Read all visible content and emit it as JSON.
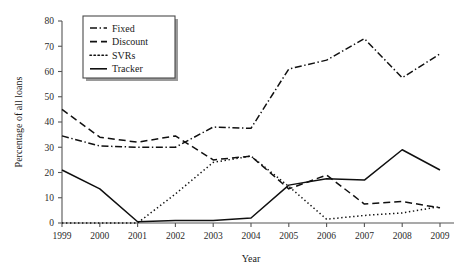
{
  "chart_data": {
    "type": "line",
    "title": "",
    "xlabel": "Year",
    "ylabel": "Percentage of all loans",
    "x": [
      1999,
      2000,
      2001,
      2002,
      2003,
      2004,
      2005,
      2006,
      2007,
      2008,
      2009
    ],
    "categories": [
      "1999",
      "2000",
      "2001",
      "2002",
      "2003",
      "2004",
      "2005",
      "2006",
      "2007",
      "2008",
      "2009"
    ],
    "xlim": [
      1999,
      2009
    ],
    "ylim": [
      0,
      80
    ],
    "ytick_values": [
      0,
      10,
      20,
      30,
      40,
      50,
      60,
      70,
      80
    ],
    "ytick_labels": [
      "0",
      "10",
      "20",
      "30",
      "40",
      "50",
      "60",
      "70",
      "80"
    ],
    "grid": false,
    "legend_position": "upper-left",
    "series": [
      {
        "name": "Fixed",
        "style": "dash-dot",
        "values": [
          34.5,
          30.5,
          30.0,
          30.0,
          38.0,
          37.5,
          61.0,
          64.5,
          73.0,
          57.5,
          67.0
        ]
      },
      {
        "name": "Discount",
        "style": "dashed",
        "values": [
          45.0,
          34.0,
          32.0,
          34.5,
          25.0,
          26.5,
          13.5,
          19.0,
          7.5,
          8.5,
          6.0
        ]
      },
      {
        "name": "SVRs",
        "style": "dotted",
        "values": [
          0.0,
          0.0,
          0.0,
          11.5,
          24.0,
          26.5,
          14.5,
          1.5,
          3.0,
          4.0,
          6.5
        ]
      },
      {
        "name": "Tracker",
        "style": "solid",
        "values": [
          21.0,
          13.5,
          0.5,
          1.0,
          1.0,
          2.0,
          15.0,
          17.5,
          17.0,
          29.0,
          21.0
        ]
      }
    ]
  },
  "legend": {
    "entries": [
      {
        "label": "Fixed",
        "style": "dash-dot"
      },
      {
        "label": "Discount",
        "style": "dashed"
      },
      {
        "label": "SVRs",
        "style": "dotted"
      },
      {
        "label": "Tracker",
        "style": "solid"
      }
    ]
  },
  "colors": {
    "series": "#101010",
    "axis": "#555555",
    "text": "#1a1a1a",
    "background": "#ffffff"
  }
}
